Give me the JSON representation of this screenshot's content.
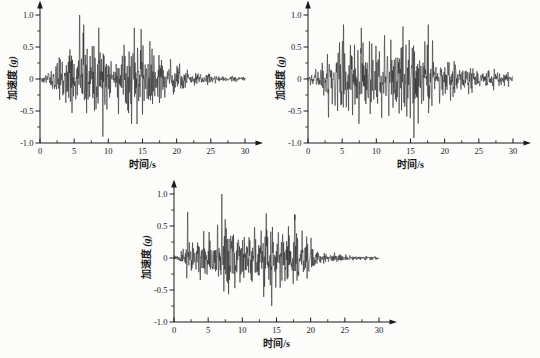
{
  "figure": {
    "description_labels": {
      "x_axis": "时间/s",
      "y_axis": "加速度 (g)"
    }
  },
  "colors": {
    "background": "#fcfcfb",
    "line": "#1c1c1c",
    "axis": "#1a1a1a",
    "text": "#1a1a1a"
  },
  "chart_data": [
    {
      "id": "top-left-accelerogram",
      "type": "line",
      "title": "",
      "xlabel": "时间/s",
      "ylabel": "加速度 (g)",
      "ylabel_text": "加速度",
      "ylabel_unit": "(g)",
      "xlim": [
        0,
        30
      ],
      "ylim": [
        -1.0,
        1.0
      ],
      "xticks": [
        "0",
        "5",
        "10",
        "15",
        "20",
        "25",
        "30"
      ],
      "yticks": [
        "1.0",
        "0.5",
        "0",
        "-0.5",
        "-1.0"
      ],
      "x_minor_step": 2.5,
      "y_minor_step": 0.25,
      "grid": false,
      "legend": null,
      "duration_s": 30,
      "peak_g": 1.0,
      "peak_time_s": 5.8,
      "negative_peak_g": -0.9,
      "base_max": 0.72,
      "seed": 13579,
      "envelope": [
        [
          0,
          0.04
        ],
        [
          0.8,
          0.08
        ],
        [
          1.5,
          0.18
        ],
        [
          2.5,
          0.38
        ],
        [
          3.5,
          0.5
        ],
        [
          5,
          0.6
        ],
        [
          6,
          0.68
        ],
        [
          7,
          0.6
        ],
        [
          8,
          0.62
        ],
        [
          9,
          0.66
        ],
        [
          10,
          0.55
        ],
        [
          11,
          0.5
        ],
        [
          12,
          0.55
        ],
        [
          13,
          0.62
        ],
        [
          14,
          0.66
        ],
        [
          15,
          0.62
        ],
        [
          16,
          0.5
        ],
        [
          17,
          0.46
        ],
        [
          18,
          0.42
        ],
        [
          19,
          0.36
        ],
        [
          20,
          0.3
        ],
        [
          21,
          0.24
        ],
        [
          22,
          0.14
        ],
        [
          23,
          0.12
        ],
        [
          24,
          0.1
        ],
        [
          25,
          0.08
        ],
        [
          26,
          0.06
        ],
        [
          27,
          0.05
        ],
        [
          28,
          0.05
        ],
        [
          29,
          0.07
        ],
        [
          30,
          0.04
        ]
      ],
      "spikes": [
        [
          5.8,
          1.0
        ],
        [
          6.4,
          0.85
        ],
        [
          8.6,
          0.8
        ],
        [
          9.2,
          -0.9
        ],
        [
          13.8,
          0.8
        ],
        [
          14.8,
          0.78
        ],
        [
          13.4,
          -0.7
        ]
      ]
    },
    {
      "id": "top-right-accelerogram",
      "type": "line",
      "title": "",
      "xlabel": "时间/s",
      "ylabel": "加速度 (g)",
      "ylabel_text": "加速度",
      "ylabel_unit": "(g)",
      "xlim": [
        0,
        30
      ],
      "ylim": [
        -1.0,
        1.0
      ],
      "xticks": [
        "0",
        "5",
        "10",
        "15",
        "20",
        "25",
        "30"
      ],
      "yticks": [
        "1.0",
        "0.5",
        "0",
        "-0.5",
        "-1.0"
      ],
      "x_minor_step": 2.5,
      "y_minor_step": 0.25,
      "grid": false,
      "legend": null,
      "duration_s": 30,
      "peak_g": 0.85,
      "peak_time_s": 5.2,
      "negative_peak_g": -0.92,
      "base_max": 0.7,
      "seed": 24680,
      "envelope": [
        [
          0,
          0.05
        ],
        [
          1,
          0.1
        ],
        [
          2,
          0.2
        ],
        [
          3,
          0.35
        ],
        [
          4,
          0.45
        ],
        [
          5,
          0.55
        ],
        [
          6,
          0.5
        ],
        [
          7,
          0.52
        ],
        [
          8,
          0.5
        ],
        [
          9,
          0.48
        ],
        [
          10,
          0.52
        ],
        [
          11,
          0.48
        ],
        [
          12,
          0.44
        ],
        [
          13,
          0.5
        ],
        [
          14,
          0.52
        ],
        [
          15,
          0.56
        ],
        [
          16,
          0.5
        ],
        [
          17,
          0.46
        ],
        [
          18,
          0.44
        ],
        [
          19,
          0.34
        ],
        [
          20,
          0.3
        ],
        [
          21,
          0.25
        ],
        [
          22,
          0.22
        ],
        [
          23,
          0.2
        ],
        [
          24,
          0.18
        ],
        [
          25,
          0.15
        ],
        [
          26,
          0.13
        ],
        [
          27,
          0.12
        ],
        [
          28,
          0.12
        ],
        [
          29,
          0.1
        ],
        [
          30,
          0.07
        ]
      ],
      "spikes": [
        [
          5.2,
          0.85
        ],
        [
          7.8,
          0.8
        ],
        [
          13.9,
          0.82
        ],
        [
          15.5,
          -0.92
        ],
        [
          17.6,
          0.85
        ],
        [
          3.0,
          -0.6
        ]
      ]
    },
    {
      "id": "bottom-center-accelerogram",
      "type": "line",
      "title": "",
      "xlabel": "时间/s",
      "ylabel": "加速度 (g)",
      "ylabel_text": "加速度",
      "ylabel_unit": "(g)",
      "xlim": [
        0,
        30
      ],
      "ylim": [
        -1.0,
        1.0
      ],
      "xticks": [
        "0",
        "5",
        "10",
        "15",
        "20",
        "25",
        "30"
      ],
      "yticks": [
        "1.0",
        "0.5",
        "0",
        "-0.5",
        "-1.0"
      ],
      "x_minor_step": 2.5,
      "y_minor_step": 0.25,
      "grid": false,
      "legend": null,
      "duration_s": 30,
      "peak_g": 1.0,
      "peak_time_s": 7.0,
      "negative_peak_g": -0.75,
      "base_max": 0.68,
      "seed": 97531,
      "envelope": [
        [
          0,
          0.03
        ],
        [
          0.7,
          0.06
        ],
        [
          1.5,
          0.25
        ],
        [
          2,
          0.35
        ],
        [
          3,
          0.4
        ],
        [
          4,
          0.42
        ],
        [
          5,
          0.48
        ],
        [
          6,
          0.52
        ],
        [
          7,
          0.6
        ],
        [
          8,
          0.5
        ],
        [
          9,
          0.48
        ],
        [
          10,
          0.44
        ],
        [
          11,
          0.5
        ],
        [
          12,
          0.55
        ],
        [
          13,
          0.58
        ],
        [
          14,
          0.6
        ],
        [
          15,
          0.55
        ],
        [
          16,
          0.55
        ],
        [
          17,
          0.5
        ],
        [
          18,
          0.48
        ],
        [
          19,
          0.4
        ],
        [
          20,
          0.34
        ],
        [
          21,
          0.18
        ],
        [
          22,
          0.1
        ],
        [
          23,
          0.08
        ],
        [
          24,
          0.07
        ],
        [
          25,
          0.06
        ],
        [
          26,
          0.05
        ],
        [
          27,
          0.04
        ],
        [
          28,
          0.04
        ],
        [
          29,
          0.03
        ],
        [
          30,
          0.03
        ]
      ],
      "spikes": [
        [
          7.0,
          1.0
        ],
        [
          2.0,
          0.72
        ],
        [
          13.5,
          0.7
        ],
        [
          14.3,
          -0.75
        ],
        [
          17.7,
          0.68
        ]
      ]
    }
  ]
}
